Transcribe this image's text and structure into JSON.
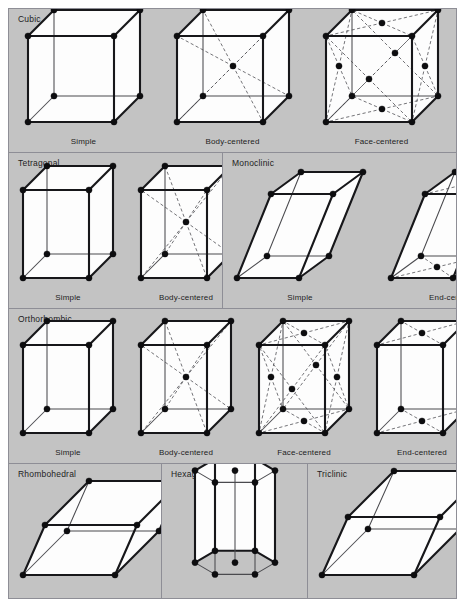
{
  "figure": {
    "background_color": "#c3c3c3",
    "border_color": "#8e8e96",
    "page_background": "#ffffff",
    "node_color": "#0d0d0f",
    "edge_color": "#17171a",
    "hidden_edge_color": "#4a4a4e",
    "dashed_line_color": "#5b5b60",
    "face_color": "#fdfdfd"
  },
  "rows": [
    {
      "name": "row-cubic",
      "panels": [
        {
          "system": "Cubic",
          "cells": [
            {
              "label": "Simple",
              "shape": "cube",
              "centering": "simple"
            },
            {
              "label": "Body-centered",
              "shape": "cube",
              "centering": "body"
            },
            {
              "label": "Face-centered",
              "shape": "cube",
              "centering": "face"
            }
          ]
        }
      ]
    },
    {
      "name": "row-tetragonal-monoclinic",
      "panels": [
        {
          "system": "Tetragonal",
          "cells": [
            {
              "label": "Simple",
              "shape": "tall",
              "centering": "simple"
            },
            {
              "label": "Body-centered",
              "shape": "tall",
              "centering": "body"
            }
          ]
        },
        {
          "system": "Monoclinic",
          "cells": [
            {
              "label": "Simple",
              "shape": "monoclinic",
              "centering": "simple"
            },
            {
              "label": "End-centered",
              "shape": "monoclinic",
              "centering": "end"
            }
          ]
        }
      ]
    },
    {
      "name": "row-orthorhombic",
      "panels": [
        {
          "system": "Orthorhombic",
          "cells": [
            {
              "label": "Simple",
              "shape": "tall",
              "centering": "simple"
            },
            {
              "label": "Body-centered",
              "shape": "tall",
              "centering": "body"
            },
            {
              "label": "Face-centered",
              "shape": "tall",
              "centering": "face"
            },
            {
              "label": "End-centered",
              "shape": "tall",
              "centering": "end"
            }
          ]
        }
      ]
    },
    {
      "name": "row-rhombohedral-hexagonal-triclinic",
      "panels": [
        {
          "system": "Rhombohedral",
          "cells": [
            {
              "label": "",
              "shape": "rhombohedral",
              "centering": "simple"
            }
          ]
        },
        {
          "system": "Hexagonal",
          "cells": [
            {
              "label": "",
              "shape": "hexagonal",
              "centering": "simple"
            }
          ]
        },
        {
          "system": "Triclinic",
          "cells": [
            {
              "label": "",
              "shape": "triclinic",
              "centering": "simple"
            }
          ]
        }
      ]
    }
  ],
  "layout": {
    "row_heights": [
      143,
      156,
      155,
      135
    ],
    "panel_widths": [
      [
        449
      ],
      [
        213,
        234
      ],
      [
        449
      ],
      [
        152,
        146,
        149
      ]
    ],
    "cell_sizes": {
      "cube": {
        "w": 86,
        "h": 86,
        "ox": 26,
        "oy": -26
      },
      "tall": {
        "w": 66,
        "h": 88,
        "ox": 24,
        "oy": -24
      },
      "monoclinic": {
        "w": 62,
        "h": 84,
        "ox": 30,
        "oy": -22,
        "shear": 34
      },
      "rhombohedral": {
        "w": 92,
        "h": 50,
        "ox": 44,
        "oy": -44,
        "shear": 22
      },
      "triclinic": {
        "w": 92,
        "h": 58,
        "ox": 46,
        "oy": -46,
        "shear": 26
      },
      "hexagonal": {
        "r": 40,
        "h": 92,
        "oy": -16
      }
    }
  }
}
